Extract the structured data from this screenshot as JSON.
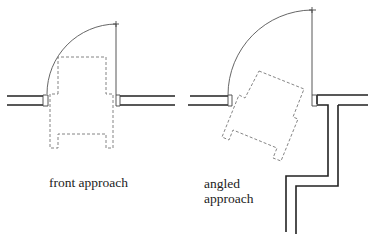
{
  "diagrams": [
    {
      "id": "front",
      "label": "front approach"
    },
    {
      "id": "angled",
      "label": "angled\napproach"
    }
  ],
  "colors": {
    "line": "#222222",
    "dashed": "#777777",
    "background": "#ffffff"
  }
}
